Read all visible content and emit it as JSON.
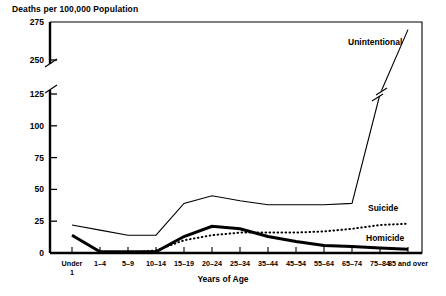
{
  "chart_data": {
    "type": "line",
    "title": "Deaths per 100,000 Population",
    "ylabel": "Deaths per 100,000 Population",
    "xlabel": "Years of Age",
    "grid": false,
    "legend_position": "inline-right-of-series",
    "categories": [
      "Under 1",
      "1–4",
      "5–9",
      "10–14",
      "15–19",
      "20–24",
      "25–34",
      "35–44",
      "45–54",
      "55–64",
      "65–74",
      "75–84",
      "85 and over"
    ],
    "ytick_labels": [
      "0",
      "25",
      "50",
      "75",
      "100",
      "125",
      "250",
      "275"
    ],
    "ytick_values": [
      0,
      25,
      50,
      75,
      100,
      125,
      250,
      275
    ],
    "yaxis_break": {
      "lower": 125,
      "upper": 250,
      "note": "axis break between 125 and 250"
    },
    "ylim": [
      0,
      275
    ],
    "series": [
      {
        "name": "Unintentional",
        "style": "thin-solid",
        "values": [
          22,
          18,
          14,
          14,
          39,
          45,
          41,
          38,
          38,
          38,
          39,
          125,
          270
        ]
      },
      {
        "name": "Suicide",
        "style": "dotted",
        "values": [
          0,
          0,
          0,
          2,
          10,
          14,
          16,
          16,
          16,
          17,
          19,
          22,
          23
        ]
      },
      {
        "name": "Homicide",
        "style": "thick-solid",
        "values": [
          14,
          1,
          1,
          1,
          13,
          21,
          19,
          13,
          9,
          6,
          5,
          4,
          3
        ]
      }
    ]
  },
  "axes": {
    "top_label": "Deaths per 100,000 Population",
    "x_axis_name": "Years of Age"
  }
}
